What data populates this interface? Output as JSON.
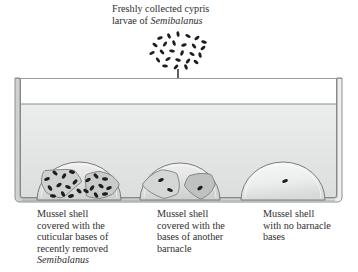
{
  "figure": {
    "background_color": "#ffffff",
    "ink_color": "#2b2b2b"
  },
  "top_label": {
    "line1": "Freshly collected cypris",
    "line2_prefix": "larvae of ",
    "line2_species": "Semibalanus"
  },
  "larvae_cluster": {
    "name": "cypris-larvae-cluster",
    "count": 26,
    "color": "#1d1d1d",
    "points": [
      {
        "x": 160,
        "y": 38,
        "r": -18
      },
      {
        "x": 169,
        "y": 36,
        "r": 62
      },
      {
        "x": 178,
        "y": 34,
        "r": 80
      },
      {
        "x": 188,
        "y": 36,
        "r": 25
      },
      {
        "x": 197,
        "y": 38,
        "r": -35
      },
      {
        "x": 204,
        "y": 42,
        "r": 15
      },
      {
        "x": 155,
        "y": 45,
        "r": 35
      },
      {
        "x": 165,
        "y": 44,
        "r": -55
      },
      {
        "x": 174,
        "y": 43,
        "r": 70
      },
      {
        "x": 184,
        "y": 45,
        "r": -20
      },
      {
        "x": 194,
        "y": 46,
        "r": 50
      },
      {
        "x": 203,
        "y": 48,
        "r": -40
      },
      {
        "x": 152,
        "y": 53,
        "r": -25
      },
      {
        "x": 162,
        "y": 52,
        "r": 45
      },
      {
        "x": 172,
        "y": 51,
        "r": 10
      },
      {
        "x": 182,
        "y": 53,
        "r": -65
      },
      {
        "x": 192,
        "y": 54,
        "r": 30
      },
      {
        "x": 200,
        "y": 55,
        "r": 75
      },
      {
        "x": 158,
        "y": 60,
        "r": 55
      },
      {
        "x": 168,
        "y": 59,
        "r": -30
      },
      {
        "x": 178,
        "y": 60,
        "r": 20
      },
      {
        "x": 188,
        "y": 61,
        "r": -50
      },
      {
        "x": 196,
        "y": 62,
        "r": 40
      },
      {
        "x": 165,
        "y": 66,
        "r": 5
      },
      {
        "x": 176,
        "y": 67,
        "r": -45
      },
      {
        "x": 186,
        "y": 67,
        "r": 65
      }
    ]
  },
  "arrow": {
    "name": "settlement-arrow",
    "x": 178,
    "y_start": 69,
    "y_end": 127,
    "color": "#1d1d1d"
  },
  "tank": {
    "name": "experimental-tank",
    "outer": {
      "x": 15,
      "y": 78,
      "width": 327,
      "height": 124
    },
    "inner": {
      "x": 20,
      "y": 82,
      "width": 317,
      "height": 116
    },
    "water_line_y": 104,
    "water_color": "#e7e9e9",
    "air_color": "#ffffff",
    "wall_color": "#8f9392",
    "wall_fill": "#d7d9d8"
  },
  "shells": [
    {
      "id": "shell-1",
      "name": "mussel-shell-cuticular-bases",
      "cx": 79,
      "base_y": 200,
      "rx": 42,
      "ry": 38,
      "fill": "#e2e3e2",
      "caption": {
        "line1": "Mussel shell",
        "line2": "covered with the",
        "line3": "cuticular bases of",
        "line4": "recently removed",
        "line5_species": "Semibalanus"
      },
      "patches": [
        {
          "cx": 60,
          "cy": 182,
          "rx": 20,
          "ry": 15,
          "fill": "#cfd1d0"
        },
        {
          "cx": 100,
          "cy": 185,
          "rx": 18,
          "ry": 14,
          "fill": "#c9cbca"
        }
      ],
      "specks": [
        {
          "x": 47,
          "y": 179,
          "r": -20
        },
        {
          "x": 55,
          "y": 173,
          "r": 40
        },
        {
          "x": 64,
          "y": 176,
          "r": -60
        },
        {
          "x": 72,
          "y": 172,
          "r": 15
        },
        {
          "x": 50,
          "y": 188,
          "r": 55
        },
        {
          "x": 59,
          "y": 185,
          "r": -35
        },
        {
          "x": 68,
          "y": 187,
          "r": 25
        },
        {
          "x": 75,
          "y": 182,
          "r": -50
        },
        {
          "x": 53,
          "y": 196,
          "r": 10
        },
        {
          "x": 63,
          "y": 194,
          "r": 65
        },
        {
          "x": 71,
          "y": 196,
          "r": -15
        },
        {
          "x": 79,
          "y": 191,
          "r": 45
        },
        {
          "x": 88,
          "y": 180,
          "r": -30
        },
        {
          "x": 96,
          "y": 176,
          "r": 50
        },
        {
          "x": 105,
          "y": 179,
          "r": 5
        },
        {
          "x": 92,
          "y": 188,
          "r": -55
        },
        {
          "x": 101,
          "y": 186,
          "r": 35
        },
        {
          "x": 109,
          "y": 188,
          "r": -25
        },
        {
          "x": 96,
          "y": 195,
          "r": 60
        },
        {
          "x": 105,
          "y": 194,
          "r": -10
        },
        {
          "x": 86,
          "y": 191,
          "r": 30
        }
      ]
    },
    {
      "id": "shell-2",
      "name": "mussel-shell-other-barnacle-bases",
      "cx": 180,
      "base_y": 200,
      "rx": 40,
      "ry": 37,
      "fill": "#e2e3e2",
      "caption": {
        "line1": "Mussel shell",
        "line2": "covered with the",
        "line3": "bases of another",
        "line4": "barnacle"
      },
      "patches": [
        {
          "cx": 163,
          "cy": 184,
          "rx": 19,
          "ry": 14,
          "fill": "#d5d7d6"
        },
        {
          "cx": 200,
          "cy": 185,
          "rx": 15,
          "ry": 13,
          "fill": "#bfc1c0"
        }
      ],
      "specks": [
        {
          "x": 161,
          "y": 180,
          "r": -25
        },
        {
          "x": 170,
          "y": 190,
          "r": 20
        },
        {
          "x": 200,
          "y": 188,
          "r": -35
        }
      ]
    },
    {
      "id": "shell-3",
      "name": "mussel-shell-no-barnacle-bases",
      "cx": 283,
      "base_y": 200,
      "rx": 42,
      "ry": 38,
      "fill": "#e8e9e8",
      "caption": {
        "line1": "Mussel shell",
        "line2": "with no barnacle",
        "line3": "bases"
      },
      "patches": [],
      "specks": [
        {
          "x": 285,
          "y": 181,
          "r": -20
        }
      ]
    }
  ]
}
